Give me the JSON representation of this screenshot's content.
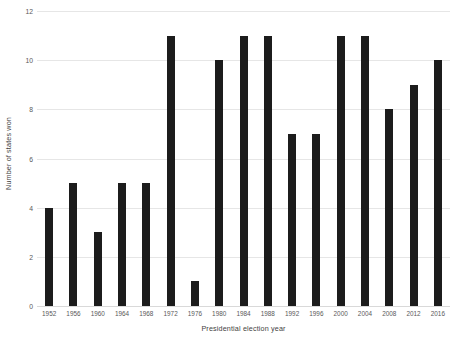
{
  "chart_data": {
    "type": "bar",
    "title": "",
    "xlabel": "Presidential election year",
    "ylabel": "Number of states won",
    "categories": [
      "1952",
      "1956",
      "1960",
      "1964",
      "1968",
      "1972",
      "1976",
      "1980",
      "1984",
      "1988",
      "1992",
      "1996",
      "2000",
      "2004",
      "2008",
      "2012",
      "2016"
    ],
    "values": [
      4,
      5,
      3,
      5,
      5,
      11,
      1,
      10,
      11,
      11,
      7,
      7,
      11,
      11,
      8,
      9,
      10
    ],
    "ylim": [
      0,
      12
    ],
    "yticks": [
      0,
      2,
      4,
      6,
      8,
      10,
      12
    ],
    "ytick_labels": [
      "0",
      "2",
      "4",
      "6",
      "8",
      "10",
      "12"
    ],
    "grid": true,
    "grid_axis": "y",
    "legend": false,
    "bar_color": "#1c1c1c",
    "gridline_color": "#e6e6e6",
    "background_color": "#ffffff",
    "text_color": "#3f3f3f"
  }
}
